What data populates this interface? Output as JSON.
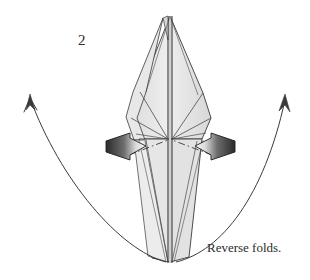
{
  "figure": {
    "step_number": "2",
    "caption": "Reverse folds.",
    "background_color": "#ffffff",
    "ink_color": "#2b2b2b"
  },
  "model": {
    "name": "origami-bird-base-narrowed",
    "paper_front_color": "#e4e4e4",
    "paper_shade_color": "#d2d2d2",
    "paper_highlight_color": "#f2f2f2",
    "edge_color": "#3a3a3a",
    "crease_line_color": "#555555"
  },
  "annotations": {
    "push_arrows": [
      {
        "name": "left-push-arrow",
        "direction": "right",
        "label": "reverse fold push left",
        "fill_dark": "#2f2f2f",
        "fill_light": "#f0f0f0"
      },
      {
        "name": "right-push-arrow",
        "direction": "left",
        "label": "reverse fold push right",
        "fill_dark": "#2f2f2f",
        "fill_light": "#f0f0f0"
      }
    ],
    "motion_arrows": [
      {
        "name": "left-motion-arrow",
        "label": "left flap swings up and out"
      },
      {
        "name": "right-motion-arrow",
        "label": "right flap swings up and out"
      }
    ],
    "fold_line": {
      "name": "reverse-fold-crease",
      "style": "dash-dot",
      "label": "reverse fold crease line"
    }
  }
}
